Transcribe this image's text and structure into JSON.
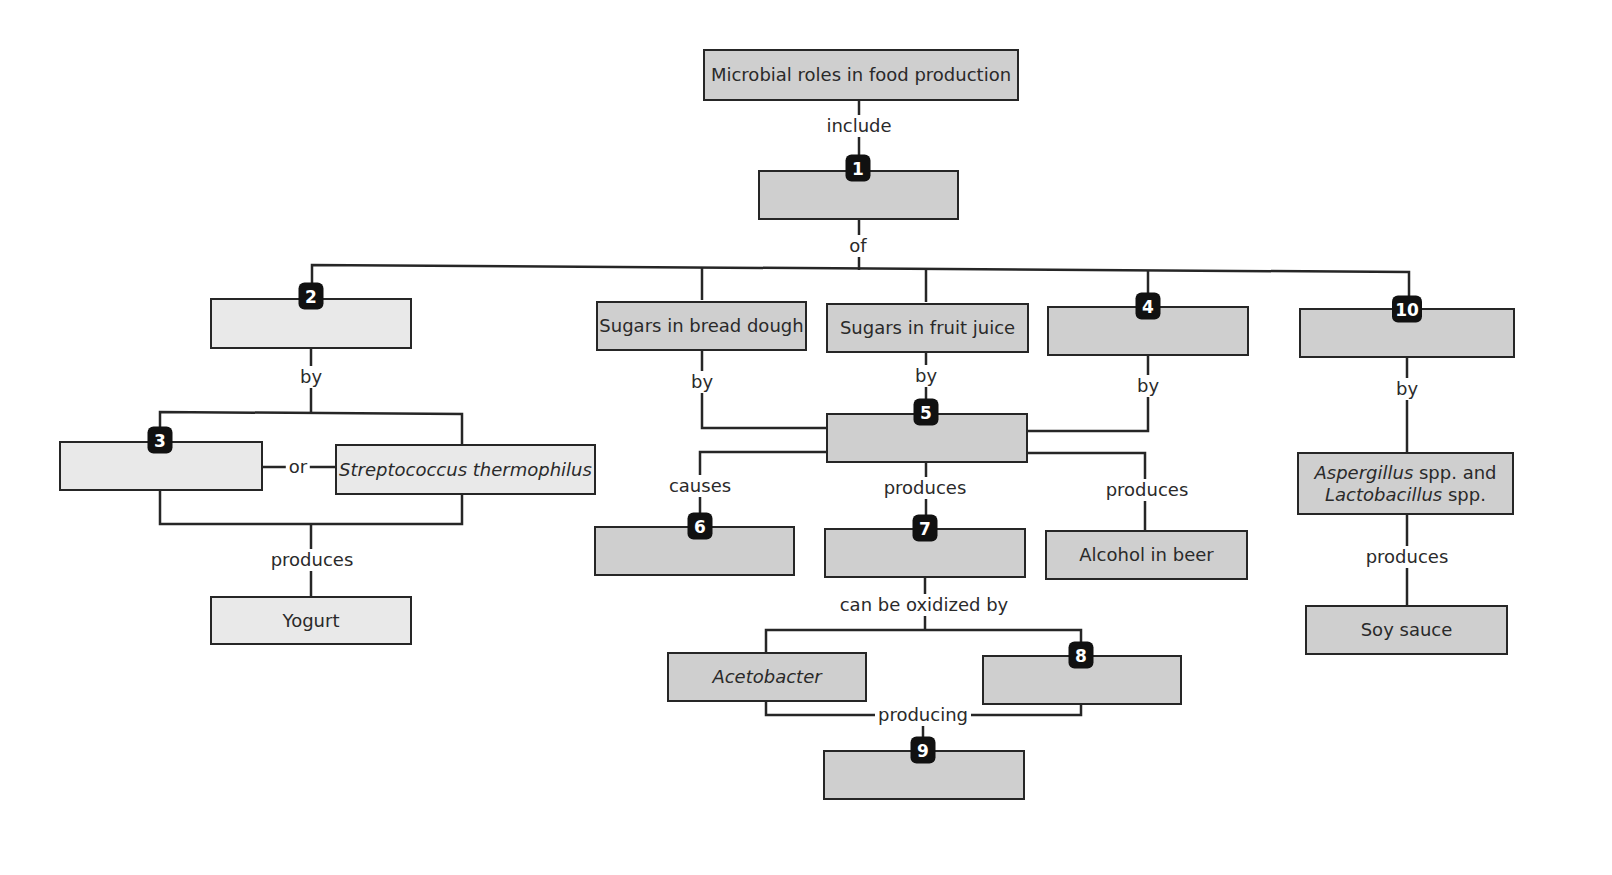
{
  "diagram": {
    "title": "Microbial roles in food production",
    "colors": {
      "node_fill": "#cfcfcf",
      "node_fill_light": "#e9e9e9",
      "border": "#262626",
      "badge": "#111111"
    },
    "nodes": {
      "root": "Microbial roles in food production",
      "n1": "",
      "n2": "",
      "n3": "",
      "strep": "Streptococcus thermophilus",
      "yogurt": "Yogurt",
      "bread": "Sugars in bread dough",
      "juice": "Sugars in fruit juice",
      "n4": "",
      "n10": "",
      "n5": "",
      "n6": "",
      "n7": "",
      "alcohol": "Alcohol in beer",
      "asper_a": "Aspergillus",
      "asper_b": " spp. and",
      "lacto_a": "Lactobacillus",
      "lacto_b": " spp.",
      "soy": "Soy sauce",
      "aceto": "Acetobacter",
      "n8": "",
      "n9": ""
    },
    "badges": {
      "b1": "1",
      "b2": "2",
      "b3": "3",
      "b4": "4",
      "b5": "5",
      "b6": "6",
      "b7": "7",
      "b8": "8",
      "b9": "9",
      "b10": "10"
    },
    "links": {
      "include": "include",
      "of": "of",
      "by_left": "by",
      "or": "or",
      "produces_yogurt": "produces",
      "by_bread": "by",
      "by_juice": "by",
      "by_4": "by",
      "by_10": "by",
      "causes": "causes",
      "produces_7": "produces",
      "produces_alcohol": "produces",
      "produces_soy": "produces",
      "oxidized": "can be oxidized by",
      "producing": "producing"
    }
  }
}
